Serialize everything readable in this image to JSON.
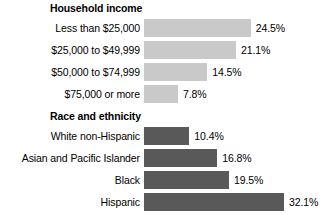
{
  "chart_data": {
    "type": "bar",
    "title": "",
    "xlabel": "",
    "ylabel": "",
    "orientation": "horizontal",
    "grid": false,
    "legend": "none",
    "xlim": [
      0,
      32.1
    ],
    "value_suffix": "%",
    "panels": [
      {
        "title": "Household income",
        "bar_color": "#c9c9c9",
        "categories": [
          "Less than $25,000",
          "$25,000 to $49,999",
          "$50,000 to $74,999",
          "$75,000 or more"
        ],
        "values": [
          24.5,
          21.1,
          14.5,
          7.8
        ],
        "value_labels": [
          "24.5%",
          "21.1%",
          "14.5%",
          "7.8%"
        ]
      },
      {
        "title": "Race and ethnicity",
        "bar_color": "#595959",
        "categories": [
          "White non-Hispanic",
          "Asian and Pacific Islander",
          "Black",
          "Hispanic"
        ],
        "values": [
          10.4,
          16.8,
          19.5,
          32.1
        ],
        "value_labels": [
          "10.4%",
          "16.8%",
          "19.5%",
          "32.1%"
        ]
      }
    ]
  },
  "colors": {
    "background": "#ffffff",
    "text": "#000000",
    "bar_light": "#c9c9c9",
    "bar_dark": "#595959"
  },
  "scale": {
    "px_per_percent": 4.36,
    "bar_origin_x": 148
  }
}
